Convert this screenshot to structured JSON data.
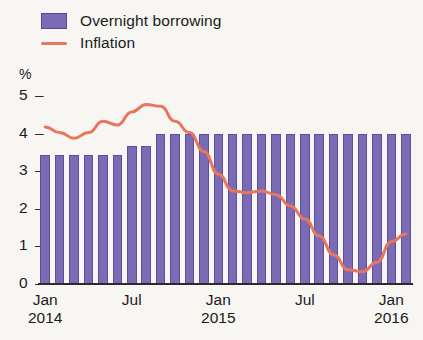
{
  "legend": {
    "items": [
      {
        "label": "Overnight borrowing",
        "type": "swatch",
        "color": "#7b6bb5",
        "name": "legend-overnight-borrowing"
      },
      {
        "label": "Inflation",
        "type": "line",
        "color": "#e8765c",
        "name": "legend-inflation"
      }
    ]
  },
  "axes": {
    "y_unit_label": "%",
    "y_ticks": [
      "5",
      "4",
      "3",
      "2",
      "1",
      "0"
    ],
    "x_ticks": [
      {
        "month": "Jan",
        "year": "2014"
      },
      {
        "month": "Jul",
        "year": ""
      },
      {
        "month": "Jan",
        "year": "2015"
      },
      {
        "month": "Jul",
        "year": ""
      },
      {
        "month": "Jan",
        "year": "2016"
      }
    ]
  },
  "colors": {
    "bar": "#7b6bb5",
    "bar_edge": "#5c4f9e",
    "line": "#e8765c",
    "axis": "#2b2b2b",
    "background": "#f8f6f3"
  },
  "chart_data": {
    "type": "bar",
    "title": "",
    "subtitle": "",
    "xlabel": "",
    "ylabel": "%",
    "ylim": [
      0,
      5
    ],
    "y_ticks": [
      0,
      1,
      2,
      3,
      4,
      5
    ],
    "grid": false,
    "legend_position": "top-left",
    "categories": [
      "Jan 2014",
      "Feb 2014",
      "Mar 2014",
      "Apr 2014",
      "May 2014",
      "Jun 2014",
      "Jul 2014",
      "Aug 2014",
      "Sep 2014",
      "Oct 2014",
      "Nov 2014",
      "Dec 2014",
      "Jan 2015",
      "Feb 2015",
      "Mar 2015",
      "Apr 2015",
      "May 2015",
      "Jun 2015",
      "Jul 2015",
      "Aug 2015",
      "Sep 2015",
      "Oct 2015",
      "Nov 2015",
      "Dec 2015",
      "Jan 2016",
      "Feb 2016"
    ],
    "series": [
      {
        "name": "Overnight borrowing",
        "type": "bar",
        "color": "#7b6bb5",
        "values": [
          3.4,
          3.4,
          3.4,
          3.4,
          3.4,
          3.4,
          3.65,
          3.65,
          3.95,
          3.95,
          3.95,
          3.95,
          3.95,
          3.95,
          3.95,
          3.95,
          3.95,
          3.95,
          3.95,
          3.95,
          3.95,
          3.95,
          3.95,
          3.95,
          3.95,
          3.95
        ]
      },
      {
        "name": "Inflation",
        "type": "line",
        "color": "#e8765c",
        "values": [
          4.15,
          4.0,
          3.85,
          4.0,
          4.3,
          4.2,
          4.55,
          4.75,
          4.7,
          4.3,
          4.0,
          3.5,
          2.9,
          2.45,
          2.4,
          2.45,
          2.35,
          2.05,
          1.7,
          1.25,
          0.75,
          0.35,
          0.3,
          0.55,
          1.1,
          1.3
        ]
      }
    ]
  }
}
